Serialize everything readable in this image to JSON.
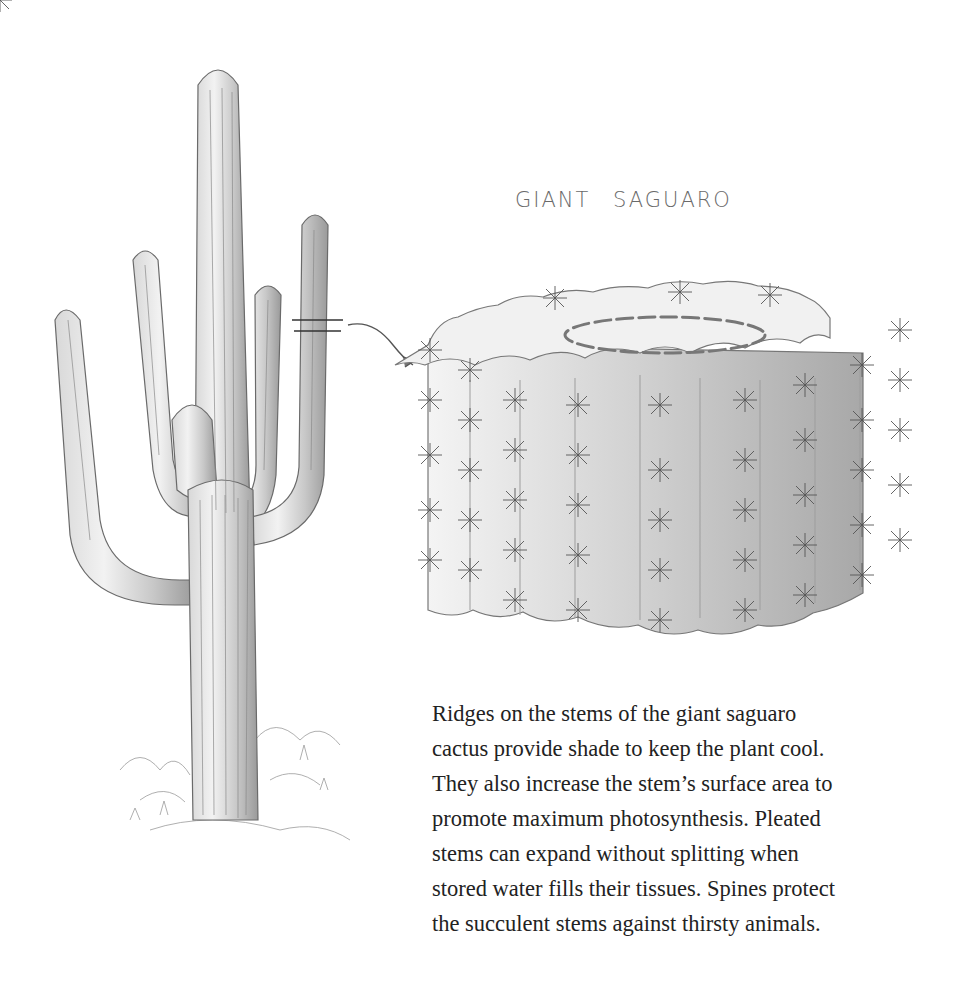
{
  "title": "GIANT SAGUARO",
  "caption": {
    "lines": [
      "Ridges on the stems of the giant saguaro",
      "cactus provide shade to keep the plant cool.",
      "They also increase the stem’s surface area to",
      "promote maximum photosynthesis. Pleated",
      "stems can expand without splitting when",
      "stored water fills their tissues. Spines protect",
      "the succulent stems against thirsty animals."
    ]
  },
  "figures": {
    "left": "saguaro-cactus-illustration",
    "right": "stem-cross-section-illustration",
    "connector": "section-marker-arrow"
  },
  "colors": {
    "background": "#ffffff",
    "pencil": "#555555",
    "shade": "#bdbdbd",
    "text": "#222222"
  }
}
